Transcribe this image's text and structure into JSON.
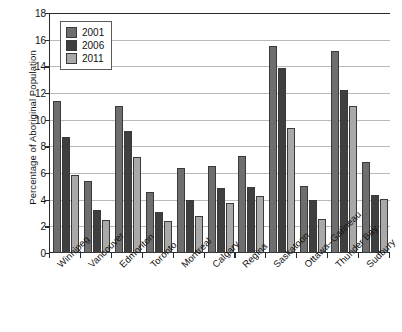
{
  "chart_data": {
    "type": "bar",
    "title": "",
    "xlabel": "",
    "ylabel": "Percentage of Aboriginal Population",
    "ylim": [
      0,
      18
    ],
    "ytick_step": 2,
    "yticks": [
      0,
      2,
      4,
      6,
      8,
      10,
      12,
      14,
      16,
      18
    ],
    "grid": true,
    "legend_position": "top-left",
    "categories": [
      "Winnipeg",
      "Vancouver",
      "Edmonton",
      "Toronto",
      "Montreal",
      "Calgary",
      "Regina",
      "Saskatoon",
      "Ottawa–Gatineau",
      "Thunder Bay",
      "Sudbury"
    ],
    "series": [
      {
        "name": "2001",
        "color": "#6e6e6e",
        "values": [
          11.4,
          5.4,
          11.0,
          4.6,
          6.4,
          6.5,
          7.25,
          15.55,
          5.05,
          15.15,
          6.85
        ]
      },
      {
        "name": "2006",
        "color": "#3f3f3f",
        "values": [
          8.7,
          3.2,
          9.15,
          3.1,
          3.95,
          4.85,
          4.95,
          13.85,
          3.95,
          12.25,
          4.35
        ]
      },
      {
        "name": "2011",
        "color": "#a9a9a9",
        "values": [
          5.85,
          2.5,
          7.2,
          2.4,
          2.8,
          3.75,
          4.25,
          9.35,
          2.55,
          11.0,
          4.05
        ]
      }
    ]
  }
}
